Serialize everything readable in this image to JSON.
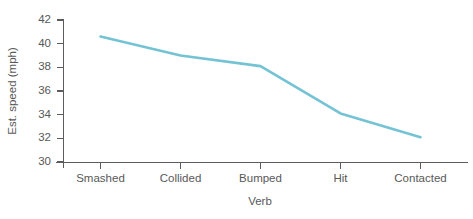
{
  "chart_data": {
    "type": "line",
    "title": "",
    "subtitle": "",
    "xlabel": "Verb",
    "ylabel": "Est. speed (mph)",
    "categories": [
      "Smashed",
      "Collided",
      "Bumped",
      "Hit",
      "Contacted"
    ],
    "values": [
      40.6,
      39.0,
      38.1,
      34.1,
      32.1
    ],
    "series": [
      {
        "name": "Est. speed (mph)",
        "values": [
          40.6,
          39.0,
          38.1,
          34.1,
          32.1
        ]
      }
    ],
    "ylim": [
      30,
      42
    ],
    "yticks": [
      30,
      32,
      34,
      36,
      38,
      40,
      42
    ],
    "ytick_labels": [
      "30",
      "32",
      "34",
      "36",
      "38",
      "40",
      "42"
    ],
    "xtick_labels": [
      "Smashed",
      "Collided",
      "Bumped",
      "Hit",
      "Contacted"
    ],
    "grid": false,
    "legend": false,
    "legend_position": "none",
    "annotations": [],
    "colors": {
      "line": "#74c3d4",
      "axis": "#5c5c5c",
      "text": "#585858",
      "background": "#ffffff"
    },
    "marker": "none",
    "line_width": 2.6
  }
}
